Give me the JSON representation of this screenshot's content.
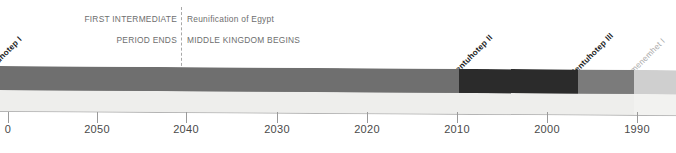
{
  "figure": {
    "type": "timeline",
    "title_visible": false,
    "era_note_left": {
      "line1": "FIRST INTERMEDIATE",
      "line2": "PERIOD ENDS"
    },
    "era_note_right": {
      "line1": "Reunification of Egypt",
      "line2": "MIDDLE KINGDOM BEGINS"
    },
    "divider": {
      "name": "era-boundary-dashed-line",
      "x_year": 2040,
      "style": "dashed"
    }
  },
  "rulers": [
    {
      "name": "mentuhotep-i",
      "label": "Mentuhotep I",
      "emphasis": "strong",
      "start_year": 2061,
      "end_year": 2061
    },
    {
      "name": "mentuhotep-ii",
      "label": "Mentuhotep II",
      "emphasis": "strong",
      "start_year": 2010,
      "end_year": 2010
    },
    {
      "name": "mentuhotep-iii",
      "label": "Mentuhotep III",
      "emphasis": "strong",
      "start_year": 1997,
      "end_year": 1997
    },
    {
      "name": "amenemhet-i",
      "label": "Amenemhet I",
      "emphasis": "faint",
      "start_year": 1991,
      "end_year": 1991
    }
  ],
  "bar_segments": [
    {
      "name": "segment-pre-mentuhotep-ii",
      "start_px": 0,
      "end_px": 459,
      "top_color": "#6f6f6f",
      "front_color": "#eeeeec"
    },
    {
      "name": "segment-mentuhotep-ii",
      "start_px": 459,
      "end_px": 578,
      "top_color": "#2b2b2b",
      "front_color": "#eeeeec"
    },
    {
      "name": "segment-mentuhotep-iii",
      "start_px": 578,
      "end_px": 634,
      "top_color": "#7b7b7b",
      "front_color": "#eeeeec"
    },
    {
      "name": "segment-amenemhet-i",
      "start_px": 634,
      "end_px": 676,
      "top_color": "#cfcfcf",
      "front_color": "#f2f2f0"
    }
  ],
  "axis": {
    "orientation": "horizontal",
    "direction": "descending-bce",
    "ticks": [
      {
        "label": "0",
        "x_px": 8,
        "truncated": true
      },
      {
        "label": "2050",
        "x_px": 97,
        "truncated": false
      },
      {
        "label": "2040",
        "x_px": 186,
        "truncated": false
      },
      {
        "label": "2030",
        "x_px": 277,
        "truncated": false
      },
      {
        "label": "2020",
        "x_px": 367,
        "truncated": false
      },
      {
        "label": "2010",
        "x_px": 457,
        "truncated": false
      },
      {
        "label": "2000",
        "x_px": 547,
        "truncated": false
      },
      {
        "label": "1990",
        "x_px": 637,
        "truncated": false
      }
    ]
  },
  "colors": {
    "background": "#ffffff",
    "annotation_text": "#6e6e6e",
    "axis_text": "#4a4a4a",
    "tick_line": "#9a9a9a",
    "divider_line": "#a8a8a8",
    "label_strong": "#1c1c1c",
    "label_faint": "#a9a9a9"
  }
}
